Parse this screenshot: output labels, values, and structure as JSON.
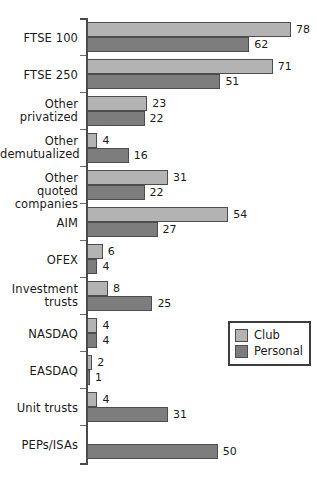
{
  "chart_data": {
    "type": "bar",
    "orientation": "horizontal",
    "title": "",
    "subtitle": "",
    "xlabel": "",
    "ylabel": "",
    "xlim": [
      0,
      78
    ],
    "grid": false,
    "legend_position": "right-middle",
    "categories": [
      "FTSE 100",
      "FTSE 250",
      "Other privatized",
      "Other demutualized",
      "Other quoted companies",
      "AIM",
      "OFEX",
      "Investment trusts",
      "NASDAQ",
      "EASDAQ",
      "Unit trusts",
      "PEPs/ISAs"
    ],
    "series": [
      {
        "name": "Club",
        "color": "#b3b3b3",
        "values": [
          78,
          71,
          23,
          4,
          31,
          54,
          6,
          8,
          4,
          2,
          4,
          null
        ]
      },
      {
        "name": "Personal",
        "color": "#7d7d7d",
        "values": [
          62,
          51,
          22,
          16,
          22,
          27,
          4,
          25,
          4,
          1,
          31,
          50
        ]
      }
    ]
  },
  "categories_display": [
    {
      "lines": [
        "FTSE 100"
      ]
    },
    {
      "lines": [
        "FTSE 250"
      ]
    },
    {
      "lines": [
        "Other",
        "privatized"
      ]
    },
    {
      "lines": [
        "Other",
        "demutualized"
      ]
    },
    {
      "lines": [
        "Other quoted",
        "companies"
      ]
    },
    {
      "lines": [
        "AIM"
      ]
    },
    {
      "lines": [
        "OFEX"
      ]
    },
    {
      "lines": [
        "Investment",
        "trusts"
      ]
    },
    {
      "lines": [
        "NASDAQ"
      ]
    },
    {
      "lines": [
        "EASDAQ"
      ]
    },
    {
      "lines": [
        "Unit trusts"
      ]
    },
    {
      "lines": [
        "PEPs/ISAs"
      ]
    }
  ],
  "legend": {
    "items": [
      {
        "label": "Club",
        "color": "#b3b3b3"
      },
      {
        "label": "Personal",
        "color": "#7d7d7d"
      }
    ]
  },
  "style": {
    "club_color": "#b3b3b3",
    "personal_color": "#7d7d7d",
    "bar_border": "#4d4d4d",
    "axis_color": "#4a4a4a",
    "text_color": "#1a1a1a",
    "background": "#ffffff"
  }
}
